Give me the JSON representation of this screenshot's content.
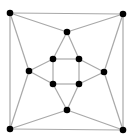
{
  "diagram": {
    "type": "graph",
    "edge_color": "#a8a8a8",
    "node_color": "#000000",
    "node_radius": 3.3,
    "nodes": [
      {
        "id": "tl",
        "x": 10,
        "y": 13
      },
      {
        "id": "tr",
        "x": 123,
        "y": 14
      },
      {
        "id": "bl",
        "x": 10,
        "y": 129
      },
      {
        "id": "br",
        "x": 123,
        "y": 130
      },
      {
        "id": "top",
        "x": 67,
        "y": 32
      },
      {
        "id": "left",
        "x": 29,
        "y": 71
      },
      {
        "id": "right",
        "x": 104,
        "y": 72
      },
      {
        "id": "bottom",
        "x": 67,
        "y": 110
      },
      {
        "id": "itl",
        "x": 53,
        "y": 59
      },
      {
        "id": "itr",
        "x": 79,
        "y": 59
      },
      {
        "id": "ibl",
        "x": 53,
        "y": 84
      },
      {
        "id": "ibr",
        "x": 79,
        "y": 84
      }
    ],
    "edges": [
      [
        "tl",
        "tr"
      ],
      [
        "tr",
        "br"
      ],
      [
        "br",
        "bl"
      ],
      [
        "bl",
        "tl"
      ],
      [
        "tl",
        "top"
      ],
      [
        "tr",
        "top"
      ],
      [
        "tl",
        "left"
      ],
      [
        "bl",
        "left"
      ],
      [
        "tr",
        "right"
      ],
      [
        "br",
        "right"
      ],
      [
        "bl",
        "bottom"
      ],
      [
        "br",
        "bottom"
      ],
      [
        "top",
        "itl"
      ],
      [
        "top",
        "itr"
      ],
      [
        "left",
        "itl"
      ],
      [
        "left",
        "ibl"
      ],
      [
        "right",
        "itr"
      ],
      [
        "right",
        "ibr"
      ],
      [
        "bottom",
        "ibl"
      ],
      [
        "bottom",
        "ibr"
      ],
      [
        "itl",
        "itr"
      ],
      [
        "itr",
        "ibr"
      ],
      [
        "ibr",
        "ibl"
      ],
      [
        "ibl",
        "itl"
      ]
    ]
  }
}
